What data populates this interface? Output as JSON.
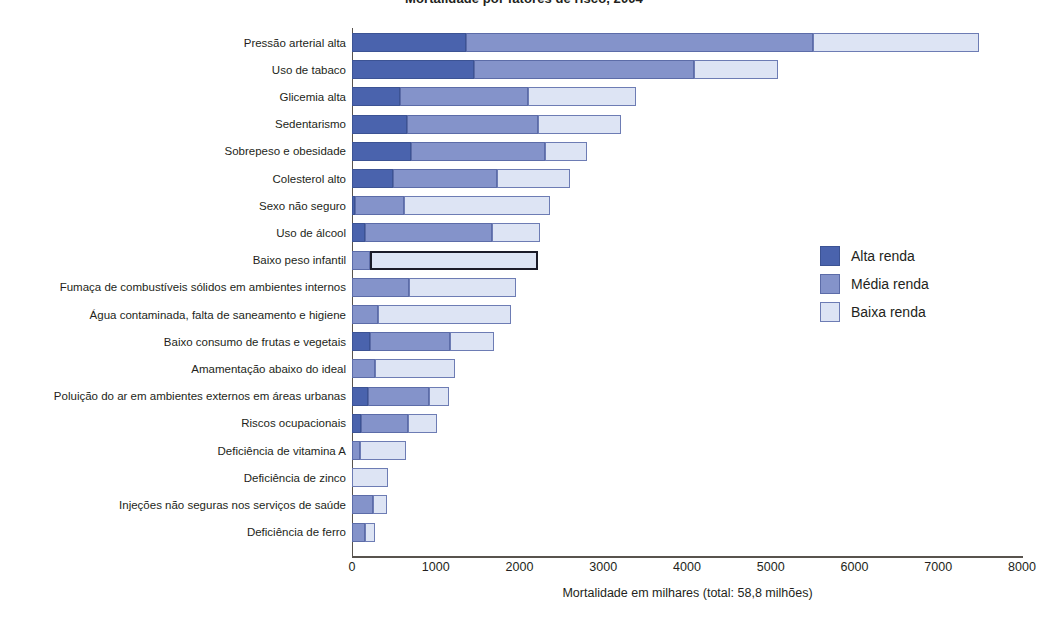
{
  "chart_data": {
    "type": "bar",
    "subtype": "horizontal-stacked",
    "title": "Mortalidade por fatores de risco, 2004",
    "xlabel": "Mortalidade em milhares (total: 58,8 milhões)",
    "ylabel": "",
    "xlim": [
      0,
      8000
    ],
    "xticks": [
      0,
      1000,
      2000,
      3000,
      4000,
      5000,
      6000,
      7000,
      8000
    ],
    "xtick_labels": [
      "0",
      "1000",
      "2000",
      "3000",
      "4000",
      "5000",
      "6000",
      "7000",
      "8000"
    ],
    "grid": false,
    "legend_position": "right-middle",
    "legend": [
      "Alta renda",
      "Média renda",
      "Baixa renda"
    ],
    "colors": {
      "alta": "#4a63ad",
      "media": "#8493ca",
      "baixa": "#dde4f4",
      "outline": "#5c6ca8",
      "axis": "#58534e",
      "text": "#231f20"
    },
    "categories": [
      "Pressão arterial alta",
      "Uso de tabaco",
      "Glicemia alta",
      "Sedentarismo",
      "Sobrepeso e obesidade",
      "Colesterol alto",
      "Sexo não seguro",
      "Uso de álcool",
      "Baixo peso infantil",
      "Fumaça de combustíveis sólidos em ambientes internos",
      "Água contaminada, falta de saneamento e higiene",
      "Baixo consumo de frutas e vegetais",
      "Amamentação abaixo do ideal",
      "Poluição do ar em ambientes externos em áreas urbanas",
      "Riscos ocupacionais",
      "Deficiência de vitamina A",
      "Deficiência de zinco",
      "Injeções não seguras nos serviços de saúde",
      "Deficiência de ferro"
    ],
    "series": [
      {
        "name": "Alta renda",
        "key": "alta",
        "values": [
          1360,
          1460,
          570,
          660,
          710,
          490,
          40,
          160,
          0,
          0,
          0,
          210,
          0,
          190,
          110,
          0,
          0,
          0,
          0
        ]
      },
      {
        "name": "Média renda",
        "key": "media",
        "values": [
          4140,
          2620,
          1530,
          1560,
          1600,
          1240,
          580,
          1510,
          210,
          680,
          310,
          960,
          270,
          730,
          560,
          100,
          0,
          250,
          160
        ]
      },
      {
        "name": "Baixa renda",
        "key": "baixa",
        "values": [
          1990,
          1010,
          1290,
          990,
          500,
          870,
          1740,
          580,
          2010,
          1280,
          1590,
          530,
          960,
          240,
          340,
          540,
          430,
          170,
          110
        ]
      }
    ],
    "totals": [
      7490,
      5090,
      3390,
      3210,
      2810,
      2600,
      2360,
      2250,
      2220,
      1960,
      1900,
      1700,
      1230,
      1160,
      1010,
      640,
      430,
      420,
      270
    ],
    "highlighted": {
      "category": "Baixo peso infantil",
      "segment": "Baixa renda"
    }
  }
}
